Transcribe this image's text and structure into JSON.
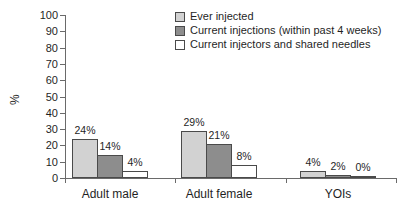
{
  "chart_data": {
    "type": "bar",
    "title": "",
    "categories": [
      "Adult male",
      "Adult female",
      "YOIs"
    ],
    "series": [
      {
        "name": "Ever injected",
        "color": "#d2d2d2",
        "values": [
          24,
          29,
          4
        ]
      },
      {
        "name": "Current injections (within past 4 weeks)",
        "color": "#8d8d8d",
        "values": [
          14,
          21,
          2
        ]
      },
      {
        "name": "Current injectors and shared needles",
        "color": "#ffffff",
        "values": [
          4,
          8,
          0
        ]
      }
    ],
    "value_label_suffix": "%",
    "ylabel": "%",
    "xlabel": "",
    "ylim": [
      0,
      100
    ],
    "yticks": [
      0,
      10,
      20,
      30,
      40,
      50,
      60,
      70,
      80,
      90,
      100
    ],
    "legend_position": "top-center",
    "grid": false,
    "bar_border_color": "#4a4a4a",
    "axis_color": "#6a6a6a",
    "text_color": "#1f1f1f"
  }
}
